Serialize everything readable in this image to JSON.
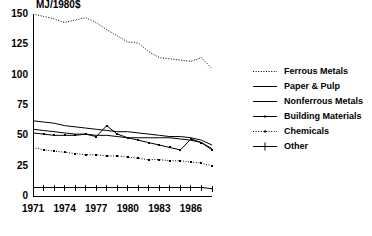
{
  "chart_data": {
    "type": "line",
    "title": "MJ/1980$",
    "xlabel": "",
    "ylabel": "MJ/1980$",
    "xlim": [
      1971,
      1988
    ],
    "ylim": [
      0,
      150
    ],
    "yticks": [
      0,
      25,
      50,
      75,
      100,
      125,
      150
    ],
    "ytick_labels": [
      "0",
      "25",
      "50",
      "75",
      "100",
      "125",
      "150"
    ],
    "xticks": [
      1971,
      1972,
      1973,
      1974,
      1975,
      1976,
      1977,
      1978,
      1979,
      1980,
      1981,
      1982,
      1983,
      1984,
      1985,
      1986,
      1987,
      1988
    ],
    "xtick_labels": [
      "1971",
      "1974",
      "1977",
      "1980",
      "1983",
      "1986"
    ],
    "xtick_label_years": [
      1971,
      1974,
      1977,
      1980,
      1983,
      1986
    ],
    "grid": false,
    "legend_position": "right",
    "x": [
      1971,
      1972,
      1973,
      1974,
      1975,
      1976,
      1977,
      1978,
      1979,
      1980,
      1981,
      1982,
      1983,
      1984,
      1985,
      1986,
      1987,
      1988
    ],
    "series": [
      {
        "name": "Ferrous Metals",
        "style": "dotted",
        "marker": "none",
        "color": "#000000",
        "values": [
          150,
          148,
          146,
          143,
          145,
          147,
          143,
          137,
          132,
          127,
          126,
          119,
          114,
          113,
          112,
          111,
          114,
          105
        ]
      },
      {
        "name": "Paper & Pulp",
        "style": "solid",
        "marker": "none",
        "color": "#000000",
        "values": [
          62,
          61,
          60,
          58,
          57,
          56,
          55,
          54,
          53,
          53,
          52,
          51,
          50,
          49,
          49,
          48,
          46,
          42
        ]
      },
      {
        "name": "Nonferrous Metals",
        "style": "solid",
        "marker": "none",
        "color": "#000000",
        "values": [
          55,
          54,
          53,
          52,
          51,
          51,
          50,
          50,
          49,
          48,
          48,
          48,
          48,
          48,
          47,
          46,
          44,
          39
        ]
      },
      {
        "name": "Building Materials",
        "style": "solid",
        "marker": "square",
        "color": "#000000",
        "values": [
          52,
          51,
          50,
          50,
          50,
          51,
          49,
          58,
          51,
          48,
          46,
          44,
          42,
          40,
          38,
          47,
          44,
          38
        ]
      },
      {
        "name": "Chemicals",
        "style": "dotted",
        "marker": "square",
        "color": "#000000",
        "values": [
          40,
          38,
          37,
          36,
          35,
          34,
          34,
          33,
          33,
          32,
          31,
          30,
          30,
          29,
          29,
          28,
          27,
          25
        ]
      },
      {
        "name": "Other",
        "style": "solid",
        "marker": "plus",
        "color": "#000000",
        "values": [
          7,
          7,
          7,
          7,
          7,
          7,
          7,
          7,
          7,
          7,
          7,
          7,
          7,
          7,
          7,
          7,
          7,
          6
        ]
      }
    ],
    "legend": [
      {
        "label": "Ferrous Metals",
        "key": "dotted"
      },
      {
        "label": "Paper & Pulp",
        "key": "solid"
      },
      {
        "label": "Nonferrous Metals",
        "key": "solid"
      },
      {
        "label": "Building Materials",
        "key": "solid-square"
      },
      {
        "label": "Chemicals",
        "key": "dotted-square"
      },
      {
        "label": "Other",
        "key": "solid-plus"
      }
    ]
  }
}
